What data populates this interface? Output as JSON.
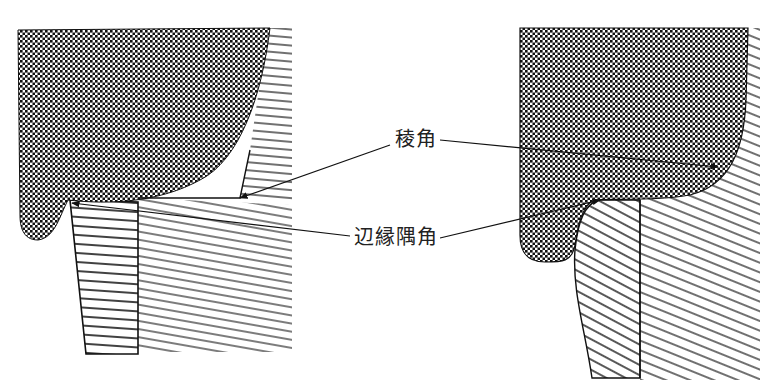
{
  "diagram": {
    "labels": {
      "ridge_corner": "稜角",
      "edge_corner": "辺縁隅角"
    },
    "panels": [
      {
        "id": "left",
        "description": "sharp edge with gap"
      },
      {
        "id": "right",
        "description": "rounded edge"
      }
    ],
    "colors": {
      "ink": "#111111",
      "background": "#ffffff"
    }
  }
}
